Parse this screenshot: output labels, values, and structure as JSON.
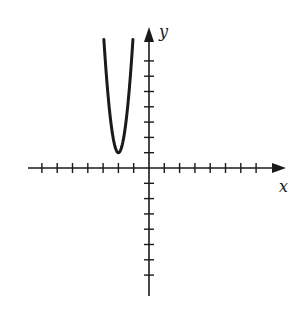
{
  "chart_data": {
    "type": "line",
    "title": "",
    "xlabel": "x",
    "ylabel": "y",
    "xlim": [
      -7,
      7
    ],
    "ylim": [
      -7,
      8
    ],
    "grid": false,
    "legend": null,
    "x_ticks": [
      -7,
      -6,
      -5,
      -4,
      -3,
      -2,
      -1,
      1,
      2,
      3,
      4,
      5,
      6,
      7
    ],
    "y_ticks": [
      -7,
      -6,
      -5,
      -4,
      -3,
      -2,
      -1,
      1,
      2,
      3,
      4,
      5,
      6,
      7
    ],
    "tick_labels_shown": false,
    "series": [
      {
        "name": "parabola",
        "description": "Upward-opening parabola, vertex near (-2, 1), approx y = 7(x+2)^2 + 1",
        "vertex": [
          -2,
          1
        ],
        "x": [
          -2.95,
          -2.75,
          -2.5,
          -2.25,
          -2.0,
          -1.75,
          -1.5,
          -1.25,
          -1.05
        ],
        "y": [
          8.4,
          4.9,
          2.75,
          1.44,
          1.0,
          1.44,
          2.75,
          4.9,
          8.4
        ],
        "color": "#1a1a1a"
      }
    ]
  },
  "labels": {
    "x_axis": "x",
    "y_axis": "y"
  },
  "colors": {
    "axis": "#1a1a1a",
    "curve": "#1a1a1a",
    "background": "#ffffff"
  }
}
